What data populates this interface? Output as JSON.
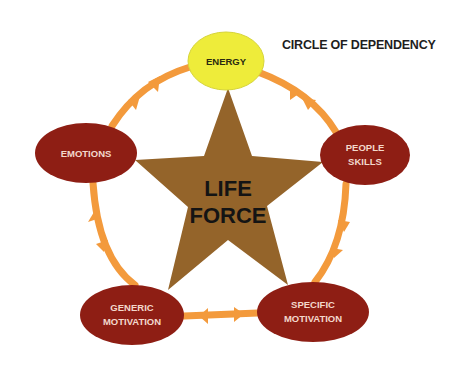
{
  "title": "CIRCLE OF DEPENDENCY",
  "colors": {
    "ring": "#f39a3c",
    "energy_fill": "#eeec3a",
    "node_fill": "#8e1e14",
    "star_fill": "#94642a",
    "node_text": "#f3d8cc",
    "center_text": "#141414"
  },
  "center": {
    "line1": "LIFE",
    "line2": "FORCE"
  },
  "nodes": [
    {
      "id": "energy",
      "line1": "ENERGY",
      "line2": ""
    },
    {
      "id": "people-skills",
      "line1": "PEOPLE",
      "line2": "SKILLS"
    },
    {
      "id": "specific-motivation",
      "line1": "SPECIFIC",
      "line2": "MOTIVATION"
    },
    {
      "id": "generic-motivation",
      "line1": "GENERIC",
      "line2": "MOTIVATION"
    },
    {
      "id": "emotions",
      "line1": "EMOTIONS",
      "line2": ""
    }
  ],
  "connections": [
    {
      "from": "energy",
      "to": "people-skills",
      "arrows": "bidirectional"
    },
    {
      "from": "people-skills",
      "to": "specific-motivation",
      "arrows": "bidirectional"
    },
    {
      "from": "specific-motivation",
      "to": "generic-motivation",
      "arrows": "bidirectional"
    },
    {
      "from": "generic-motivation",
      "to": "emotions",
      "arrows": "bidirectional"
    },
    {
      "from": "emotions",
      "to": "energy",
      "arrows": "bidirectional"
    }
  ]
}
